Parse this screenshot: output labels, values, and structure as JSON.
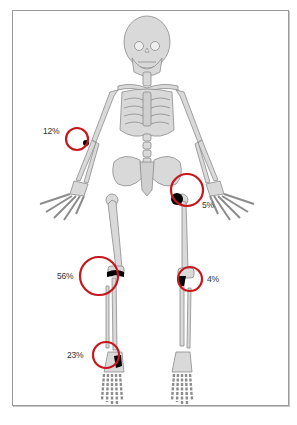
{
  "diagram": {
    "colors": {
      "bone_fill": "#d9d9d9",
      "bone_stroke": "#8c8c8c",
      "marker_ring": "#c8161d",
      "lesion": "#000000",
      "frame": "#9a9a9a"
    },
    "markers": [
      {
        "id": "elbow-right",
        "label": "12%",
        "site": "elbow"
      },
      {
        "id": "hip-left",
        "label": "5%",
        "site": "hip"
      },
      {
        "id": "knee-right",
        "label": "56%",
        "site": "knee"
      },
      {
        "id": "knee-left",
        "label": "4%",
        "site": "knee"
      },
      {
        "id": "ankle-right",
        "label": "23%",
        "site": "ankle"
      }
    ]
  }
}
